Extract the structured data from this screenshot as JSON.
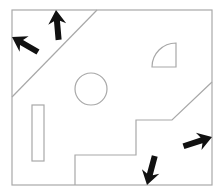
{
  "diagram": {
    "colors": {
      "line": "#a8a8a8",
      "arrow": "#111111",
      "background": "#ffffff"
    },
    "frame": {
      "x": 12,
      "y": 10,
      "width": 200,
      "height": 175
    },
    "shapes": [
      {
        "type": "line",
        "name": "top-left-diagonal",
        "from": [
          12,
          97
        ],
        "to": [
          97,
          10
        ]
      },
      {
        "type": "polyline",
        "name": "bottom-right-stair",
        "points": [
          [
            75,
            185
          ],
          [
            75,
            155
          ],
          [
            136,
            155
          ],
          [
            136,
            120
          ],
          [
            172,
            120
          ],
          [
            212,
            82
          ]
        ]
      },
      {
        "type": "circle",
        "name": "center-circle",
        "cx": 91,
        "cy": 89,
        "r": 16
      },
      {
        "type": "quarter-circle",
        "name": "quarter-circle",
        "corner": [
          176,
          67
        ],
        "r": 24
      },
      {
        "type": "rect",
        "name": "tall-rectangle",
        "x": 32,
        "y": 105,
        "width": 12,
        "height": 56
      }
    ],
    "arrows": [
      {
        "name": "arrow-up-left",
        "tip": [
          12,
          37
        ],
        "direction": "up-left"
      },
      {
        "name": "arrow-up",
        "tip": [
          56,
          10
        ],
        "direction": "up"
      },
      {
        "name": "arrow-right",
        "tip": [
          212,
          137
        ],
        "direction": "right"
      },
      {
        "name": "arrow-down",
        "tip": [
          147,
          185
        ],
        "direction": "down"
      }
    ]
  }
}
